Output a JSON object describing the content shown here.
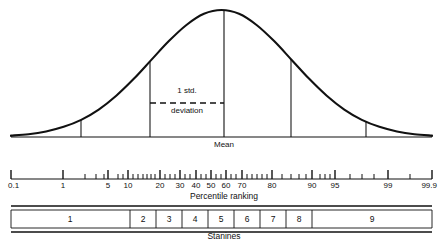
{
  "figure": {
    "type": "normal-distribution-diagram",
    "title": "",
    "background": "#ffffff",
    "ink": "#111111"
  },
  "curve": {
    "label_mean": "Mean",
    "label_sd_line1": "1 std.",
    "label_sd_line2": "deviation",
    "baseline_y": 137,
    "peak_y": 10,
    "left_x": 11,
    "right_x": 432,
    "mean_x": 224,
    "sd_lines_x": [
      81,
      150,
      291,
      366
    ],
    "dashed_line": {
      "x1": 150,
      "x2": 224,
      "y": 103
    }
  },
  "percentile_axis": {
    "caption": "Percentile ranking",
    "axis_y": 179,
    "left_x": 11,
    "right_x": 432,
    "labels": [
      "0.1",
      "1",
      "5",
      "10",
      "20",
      "30",
      "40",
      "50",
      "60",
      "70",
      "80",
      "90",
      "95",
      "99",
      "99.9"
    ],
    "label_x": [
      11,
      63,
      108,
      128,
      160,
      180,
      196,
      211,
      226,
      242,
      272,
      312,
      335,
      388,
      432
    ],
    "major_ticks_x": [
      11,
      63,
      108,
      128,
      160,
      180,
      196,
      211,
      226,
      242,
      272,
      312,
      335,
      388,
      432
    ],
    "minor_ticks_x": [
      85,
      96,
      104,
      118,
      123,
      133,
      138,
      143,
      147,
      151,
      155,
      165,
      170,
      175,
      185,
      190,
      201,
      206,
      216,
      221,
      231,
      236,
      247,
      252,
      257,
      262,
      267,
      282,
      291,
      299,
      306,
      320,
      325,
      330,
      350,
      362,
      374,
      410
    ]
  },
  "stanines": {
    "caption": "Stanines",
    "box_top": 210,
    "box_bottom": 228,
    "left_x": 11,
    "right_x": 432,
    "dividers_x": [
      130,
      156,
      182,
      208,
      234,
      260,
      286,
      312
    ],
    "cells": [
      {
        "label": "1",
        "center_x": 70
      },
      {
        "label": "2",
        "center_x": 143
      },
      {
        "label": "3",
        "center_x": 169
      },
      {
        "label": "4",
        "center_x": 195
      },
      {
        "label": "5",
        "center_x": 221
      },
      {
        "label": "6",
        "center_x": 247
      },
      {
        "label": "7",
        "center_x": 273
      },
      {
        "label": "8",
        "center_x": 299
      },
      {
        "label": "9",
        "center_x": 372
      }
    ]
  },
  "chart_data": {
    "type": "line",
    "xlabel": "Percentile ranking",
    "ylabel": "",
    "grid": false,
    "legend": "none",
    "xlim": [
      -3,
      3
    ],
    "ylim": [
      0,
      1
    ],
    "series": [
      {
        "name": "Normal curve (relative frequency)",
        "x": [
          -3.0,
          -2.75,
          -2.5,
          -2.25,
          -2.0,
          -1.75,
          -1.5,
          -1.25,
          -1.0,
          -0.75,
          -0.5,
          -0.25,
          0.0,
          0.25,
          0.5,
          0.75,
          1.0,
          1.25,
          1.5,
          1.75,
          2.0,
          2.25,
          2.5,
          2.75,
          3.0
        ],
        "y": [
          0.011,
          0.022,
          0.044,
          0.08,
          0.135,
          0.216,
          0.325,
          0.458,
          0.607,
          0.755,
          0.882,
          0.97,
          1.0,
          0.97,
          0.882,
          0.755,
          0.607,
          0.458,
          0.325,
          0.216,
          0.135,
          0.08,
          0.044,
          0.022,
          0.011
        ]
      }
    ],
    "annotations": [
      {
        "text": "Mean",
        "x": 0.0,
        "kind": "vertical-line-label"
      },
      {
        "text": "1 std. deviation",
        "x_from": -1.0,
        "x_to": 0.0,
        "kind": "dashed-span"
      }
    ],
    "reference_lines_sd": [
      -2,
      -1,
      1,
      2
    ],
    "percentile_tick_labels": [
      "0.1",
      "1",
      "5",
      "10",
      "20",
      "30",
      "40",
      "50",
      "60",
      "70",
      "80",
      "90",
      "95",
      "99",
      "99.9"
    ],
    "stanine_labels": [
      "1",
      "2",
      "3",
      "4",
      "5",
      "6",
      "7",
      "8",
      "9"
    ],
    "stanine_percent": [
      4,
      7,
      12,
      17,
      20,
      17,
      12,
      7,
      4
    ]
  }
}
